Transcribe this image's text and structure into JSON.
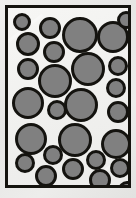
{
  "poster": {
    "title": "Gray Circles Poster",
    "caption": "",
    "colors": {
      "frame_border": "#15140f",
      "inner_background": "#f3f3f1",
      "outer_background": "#e9e9e7",
      "circle_fill": "#808080",
      "circle_outline": "#14130f"
    },
    "frame": {
      "left": 5,
      "top": 5,
      "width": 126,
      "height": 183,
      "border_width": 3
    }
  },
  "chart_data": {
    "type": "scatter",
    "subtitle": "",
    "xlabel": "",
    "ylabel": "",
    "xlim": [
      0,
      120
    ],
    "ylim": [
      0,
      177
    ],
    "grid": false,
    "legend": null,
    "series": [
      {
        "name": "circles",
        "fill": "#808080",
        "outline": "#14130f",
        "outline_width": 3,
        "count": 27,
        "points": [
          {
            "id": 1,
            "x": 42,
            "y": 20,
            "r": 11
          },
          {
            "id": 2,
            "x": 72,
            "y": 27,
            "r": 18
          },
          {
            "id": 3,
            "x": 105,
            "y": 29,
            "r": 16
          },
          {
            "id": 4,
            "x": 20,
            "y": 36,
            "r": 12
          },
          {
            "id": 5,
            "x": 46,
            "y": 44,
            "r": 11
          },
          {
            "id": 6,
            "x": 20,
            "y": 61,
            "r": 11
          },
          {
            "id": 7,
            "x": 80,
            "y": 61,
            "r": 17
          },
          {
            "id": 8,
            "x": 110,
            "y": 58,
            "r": 10
          },
          {
            "id": 9,
            "x": 47,
            "y": 73,
            "r": 17
          },
          {
            "id": 10,
            "x": 108,
            "y": 80,
            "r": 10
          },
          {
            "id": 11,
            "x": 20,
            "y": 95,
            "r": 16
          },
          {
            "id": 12,
            "x": 73,
            "y": 97,
            "r": 17
          },
          {
            "id": 13,
            "x": 49,
            "y": 102,
            "r": 10
          },
          {
            "id": 14,
            "x": 110,
            "y": 104,
            "r": 11
          },
          {
            "id": 15,
            "x": 23,
            "y": 131,
            "r": 16
          },
          {
            "id": 16,
            "x": 67,
            "y": 132,
            "r": 17
          },
          {
            "id": 17,
            "x": 108,
            "y": 136,
            "r": 15
          },
          {
            "id": 18,
            "x": 45,
            "y": 147,
            "r": 10
          },
          {
            "id": 19,
            "x": 88,
            "y": 152,
            "r": 10
          },
          {
            "id": 20,
            "x": 17,
            "y": 155,
            "r": 10
          },
          {
            "id": 21,
            "x": 65,
            "y": 161,
            "r": 11
          },
          {
            "id": 22,
            "x": 112,
            "y": 160,
            "r": 10
          },
          {
            "id": 23,
            "x": 38,
            "y": 168,
            "r": 11
          },
          {
            "id": 24,
            "x": 92,
            "y": 172,
            "r": 11
          },
          {
            "id": 25,
            "x": 14,
            "y": 14,
            "r": 9
          },
          {
            "id": 26,
            "x": 118,
            "y": 12,
            "r": 9
          },
          {
            "id": 27,
            "x": 119,
            "y": 182,
            "r": 9
          }
        ]
      }
    ]
  }
}
